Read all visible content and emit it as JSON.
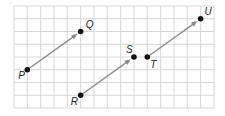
{
  "grid": {
    "origin_x": 14,
    "origin_y": 6,
    "cell_w": 13.33,
    "cell_h": 12.75,
    "cols": 15,
    "rows": 8,
    "line_color": "#d9d9d9"
  },
  "colors": {
    "vector": "#8c8c8c",
    "point": "#111111"
  },
  "points": [
    {
      "name": "P",
      "gx": 1,
      "gy": 5,
      "label_dx": -9,
      "label_dy": 9
    },
    {
      "name": "Q",
      "gx": 5,
      "gy": 2,
      "label_dx": 5,
      "label_dy": -4
    },
    {
      "name": "R",
      "gx": 5,
      "gy": 7,
      "label_dx": -10,
      "label_dy": 10
    },
    {
      "name": "S",
      "gx": 9,
      "gy": 4,
      "label_dx": -8,
      "label_dy": -4
    },
    {
      "name": "T",
      "gx": 10,
      "gy": 4,
      "label_dx": 3,
      "label_dy": 11
    },
    {
      "name": "U",
      "gx": 14,
      "gy": 1,
      "label_dx": 4,
      "label_dy": -4
    }
  ],
  "vectors": [
    {
      "from": "P",
      "to": "Q"
    },
    {
      "from": "R",
      "to": "S"
    },
    {
      "from": "T",
      "to": "U"
    }
  ]
}
